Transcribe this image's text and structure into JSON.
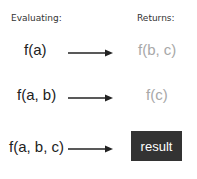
{
  "headers": {
    "evaluating": "Evaluating:",
    "returns": "Returns:"
  },
  "rows": [
    {
      "input": "f(a)",
      "output": "f(b, c)"
    },
    {
      "input": "f(a, b)",
      "output": "f(c)"
    },
    {
      "input": "f(a, b, c)",
      "output": "result"
    }
  ],
  "colors": {
    "returns_text": "#a8a8a8",
    "result_bg": "#333333",
    "result_text": "#ffffff"
  }
}
